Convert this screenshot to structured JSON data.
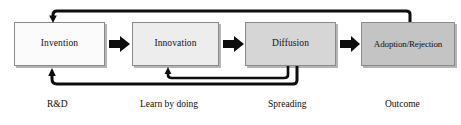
{
  "diagram": {
    "background_color": "#ffffff",
    "line_color": "#111111",
    "border_color": "#8a8a8a",
    "stages": [
      {
        "id": "invention",
        "label": "Invention",
        "caption": "R&D",
        "fill_color": "#fbfbfb"
      },
      {
        "id": "innovation",
        "label": "Innovation",
        "caption": "Learn by doing",
        "fill_color": "#ededed"
      },
      {
        "id": "diffusion",
        "label": "Diffusion",
        "caption": "Spreading",
        "fill_color": "#d6d6d6"
      },
      {
        "id": "adoption-rejection",
        "label": "Adoption/Rejection",
        "caption": "Outcome",
        "fill_color": "#c4c4c4"
      }
    ],
    "forward_arrows": [
      {
        "id": "arrow-invention-to-innovation",
        "from": "invention",
        "to": "innovation"
      },
      {
        "id": "arrow-innovation-to-diffusion",
        "from": "innovation",
        "to": "diffusion"
      },
      {
        "id": "arrow-diffusion-to-adoption",
        "from": "diffusion",
        "to": "adoption-rejection"
      }
    ],
    "feedback_arrows": [
      {
        "id": "feedback-adoption-to-invention",
        "from": "adoption-rejection",
        "to": "invention",
        "route": "top"
      },
      {
        "id": "feedback-diffusion-to-invention",
        "from": "diffusion",
        "to": "invention",
        "route": "bottom-outer"
      },
      {
        "id": "feedback-diffusion-to-innovation",
        "from": "diffusion",
        "to": "innovation",
        "route": "bottom-inner"
      }
    ]
  }
}
